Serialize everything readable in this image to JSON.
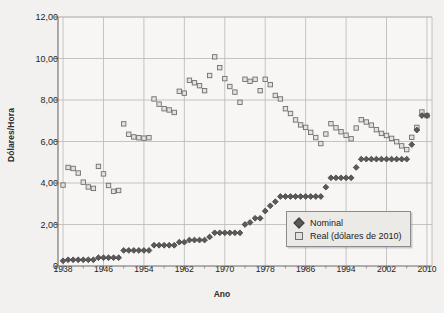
{
  "chart_data": {
    "type": "scatter",
    "title": "",
    "xlabel": "Ano",
    "ylabel": "Dólares/Hora",
    "xlim": [
      1937,
      2011
    ],
    "ylim": [
      0,
      12
    ],
    "grid": true,
    "legend_position": "bottom-right",
    "y_ticks": [
      "0",
      "2,00",
      "4,00",
      "6,00",
      "8,00",
      "10,00",
      "12,00"
    ],
    "y_tick_values": [
      0,
      2,
      4,
      6,
      8,
      10,
      12
    ],
    "x_ticks": [
      "1938",
      "1946",
      "1954",
      "1962",
      "1970",
      "1978",
      "1986",
      "1994",
      "2002",
      "2010"
    ],
    "x_tick_values": [
      1938,
      1946,
      1954,
      1962,
      1970,
      1978,
      1986,
      1994,
      2002,
      2010
    ],
    "series": [
      {
        "name": "Nominal",
        "marker": "diamond",
        "color": "#5a5a5a",
        "x": [
          1938,
          1939,
          1940,
          1941,
          1942,
          1943,
          1944,
          1945,
          1946,
          1947,
          1948,
          1949,
          1950,
          1951,
          1952,
          1953,
          1954,
          1955,
          1956,
          1957,
          1958,
          1959,
          1960,
          1961,
          1962,
          1963,
          1964,
          1965,
          1966,
          1967,
          1968,
          1969,
          1970,
          1971,
          1972,
          1973,
          1974,
          1975,
          1976,
          1977,
          1978,
          1979,
          1980,
          1981,
          1982,
          1983,
          1984,
          1985,
          1986,
          1987,
          1988,
          1989,
          1990,
          1991,
          1992,
          1993,
          1994,
          1995,
          1996,
          1997,
          1998,
          1999,
          2000,
          2001,
          2002,
          2003,
          2004,
          2005,
          2006,
          2007,
          2008,
          2009,
          2010
        ],
        "values": [
          0.25,
          0.3,
          0.3,
          0.3,
          0.3,
          0.3,
          0.3,
          0.4,
          0.4,
          0.4,
          0.4,
          0.4,
          0.75,
          0.75,
          0.75,
          0.75,
          0.75,
          0.75,
          1.0,
          1.0,
          1.0,
          1.0,
          1.0,
          1.15,
          1.15,
          1.25,
          1.25,
          1.25,
          1.25,
          1.4,
          1.6,
          1.6,
          1.6,
          1.6,
          1.6,
          1.6,
          2.0,
          2.1,
          2.3,
          2.3,
          2.65,
          2.9,
          3.1,
          3.35,
          3.35,
          3.35,
          3.35,
          3.35,
          3.35,
          3.35,
          3.35,
          3.35,
          3.8,
          4.25,
          4.25,
          4.25,
          4.25,
          4.25,
          4.75,
          5.15,
          5.15,
          5.15,
          5.15,
          5.15,
          5.15,
          5.15,
          5.15,
          5.15,
          5.15,
          5.85,
          6.55,
          7.25,
          7.25
        ]
      },
      {
        "name": "Real (dólares de 2010)",
        "marker": "square",
        "color": "#e4e2df",
        "x": [
          1938,
          1939,
          1940,
          1941,
          1942,
          1943,
          1944,
          1945,
          1946,
          1947,
          1948,
          1949,
          1950,
          1951,
          1952,
          1953,
          1954,
          1955,
          1956,
          1957,
          1958,
          1959,
          1960,
          1961,
          1962,
          1963,
          1964,
          1965,
          1966,
          1967,
          1968,
          1969,
          1970,
          1971,
          1972,
          1973,
          1974,
          1975,
          1976,
          1977,
          1978,
          1979,
          1980,
          1981,
          1982,
          1983,
          1984,
          1985,
          1986,
          1987,
          1988,
          1989,
          1990,
          1991,
          1992,
          1993,
          1994,
          1995,
          1996,
          1997,
          1998,
          1999,
          2000,
          2001,
          2002,
          2003,
          2004,
          2005,
          2006,
          2007,
          2008,
          2009,
          2010
        ],
        "values": [
          3.9,
          4.75,
          4.7,
          4.48,
          4.04,
          3.81,
          3.74,
          4.8,
          4.44,
          3.88,
          3.6,
          3.64,
          6.85,
          6.35,
          6.22,
          6.18,
          6.16,
          6.18,
          8.05,
          7.8,
          7.58,
          7.52,
          7.4,
          8.42,
          8.33,
          8.95,
          8.83,
          8.69,
          8.45,
          9.18,
          10.08,
          9.56,
          9.03,
          8.65,
          8.38,
          7.89,
          9.0,
          8.9,
          9.0,
          8.45,
          9.0,
          8.74,
          8.22,
          8.05,
          7.58,
          7.35,
          7.04,
          6.8,
          6.68,
          6.44,
          6.19,
          5.9,
          6.36,
          6.86,
          6.66,
          6.47,
          6.3,
          6.13,
          6.65,
          7.05,
          6.94,
          6.79,
          6.57,
          6.39,
          6.29,
          6.15,
          5.99,
          5.79,
          5.61,
          6.2,
          6.68,
          7.42,
          7.25
        ]
      }
    ]
  },
  "legend": {
    "items": [
      {
        "label": "Nominal"
      },
      {
        "label": "Real (dólares de 2010)"
      }
    ]
  }
}
